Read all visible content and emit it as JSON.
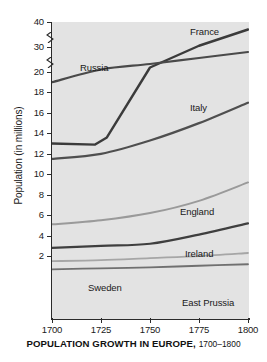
{
  "caption": {
    "main": "POPULATION GROWTH IN EUROPE,",
    "years": "1700–1800"
  },
  "chart_data": {
    "type": "line",
    "xlabel": "",
    "ylabel": "Population (in millions)",
    "x": [
      1700,
      1725,
      1750,
      1775,
      1800
    ],
    "xlim": [
      1700,
      1800
    ],
    "x_ticks": [
      "1700",
      "1725",
      "1750",
      "1775",
      "1800"
    ],
    "y_ticks": [
      "2",
      "4",
      "6",
      "8",
      "10",
      "12",
      "14",
      "16",
      "18",
      "20",
      "30",
      "40"
    ],
    "ylim": [
      0,
      40
    ],
    "y_axis_broken": true,
    "y_break_note": "Axis compressed above 20: breaks between 20–30 and 30–40",
    "grid": false,
    "legend": "inline-labels",
    "plot_background": "#e3e3e3",
    "series": [
      {
        "name": "France",
        "color": "#3b3b3b",
        "label_position": "top-right",
        "values": [
          13.0,
          12.9,
          22.0,
          30.5,
          37.0
        ],
        "points": [
          {
            "x": 1700,
            "y": 13.0
          },
          {
            "x": 1722,
            "y": 12.9
          },
          {
            "x": 1728,
            "y": 13.6
          },
          {
            "x": 1750,
            "y": 21.8
          },
          {
            "x": 1775,
            "y": 30.5
          },
          {
            "x": 1800,
            "y": 37.0
          }
        ]
      },
      {
        "name": "Russia",
        "color": "#4a4a4a",
        "label_position": "upper-left",
        "values": [
          19.0,
          21.0,
          23.2,
          25.6,
          28.0
        ],
        "points": [
          {
            "x": 1700,
            "y": 19.0
          },
          {
            "x": 1725,
            "y": 21.0
          },
          {
            "x": 1750,
            "y": 23.2
          },
          {
            "x": 1775,
            "y": 25.6
          },
          {
            "x": 1800,
            "y": 28.0
          }
        ]
      },
      {
        "name": "Italy",
        "color": "#4f4f4f",
        "label_position": "right-mid",
        "values": [
          11.5,
          12.0,
          13.3,
          15.0,
          17.0
        ],
        "points": [
          {
            "x": 1700,
            "y": 11.5
          },
          {
            "x": 1725,
            "y": 12.0
          },
          {
            "x": 1750,
            "y": 13.3
          },
          {
            "x": 1775,
            "y": 15.0
          },
          {
            "x": 1800,
            "y": 17.0
          }
        ]
      },
      {
        "name": "England",
        "color": "#9a9a9a",
        "label_position": "right-lower",
        "values": [
          5.1,
          5.5,
          6.2,
          7.4,
          9.2
        ],
        "points": [
          {
            "x": 1700,
            "y": 5.1
          },
          {
            "x": 1725,
            "y": 5.5
          },
          {
            "x": 1750,
            "y": 6.2
          },
          {
            "x": 1775,
            "y": 7.4
          },
          {
            "x": 1800,
            "y": 9.2
          }
        ]
      },
      {
        "name": "Ireland",
        "color": "#3f3f3f",
        "label_position": "right-lower",
        "values": [
          2.8,
          3.0,
          3.2,
          4.1,
          5.2
        ],
        "points": [
          {
            "x": 1700,
            "y": 2.8
          },
          {
            "x": 1725,
            "y": 3.0
          },
          {
            "x": 1750,
            "y": 3.2
          },
          {
            "x": 1775,
            "y": 4.1
          },
          {
            "x": 1800,
            "y": 5.2
          }
        ]
      },
      {
        "name": "Sweden",
        "color": "#a6a6a6",
        "label_position": "bottom-center",
        "values": [
          1.5,
          1.6,
          1.8,
          2.0,
          2.3
        ],
        "points": [
          {
            "x": 1700,
            "y": 1.5
          },
          {
            "x": 1725,
            "y": 1.6
          },
          {
            "x": 1750,
            "y": 1.8
          },
          {
            "x": 1775,
            "y": 2.0
          },
          {
            "x": 1800,
            "y": 2.3
          }
        ]
      },
      {
        "name": "East Prussia",
        "color": "#707070",
        "label_position": "bottom-right",
        "values": [
          0.7,
          0.8,
          0.9,
          1.05,
          1.2
        ],
        "points": [
          {
            "x": 1700,
            "y": 0.7
          },
          {
            "x": 1725,
            "y": 0.8
          },
          {
            "x": 1750,
            "y": 0.9
          },
          {
            "x": 1775,
            "y": 1.05
          },
          {
            "x": 1800,
            "y": 1.2
          }
        ]
      }
    ]
  }
}
